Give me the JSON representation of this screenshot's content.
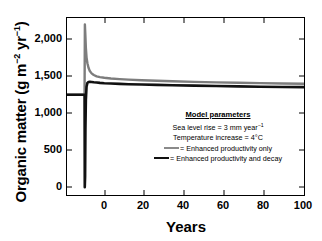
{
  "chart_data": {
    "type": "line",
    "title": "",
    "xlabel": "Years",
    "ylabel": "Organic matter (g m-2 yr-1)",
    "ylabel_parts": {
      "main": "Organic matter (g m",
      "sup1": "−2",
      "mid": " yr",
      "sup2": "−1",
      "end": ")"
    },
    "xlim": [
      -8,
      100
    ],
    "ylim": [
      -400,
      2300
    ],
    "xticks": [
      0,
      20,
      40,
      60,
      80,
      100
    ],
    "xtick_labels": [
      "0",
      "20",
      "40",
      "60",
      "80",
      "100"
    ],
    "yticks": [
      0,
      500,
      1000,
      1500,
      2000
    ],
    "ytick_labels": [
      "0",
      "500",
      "1,000",
      "1,500",
      "2,000"
    ],
    "grid": false,
    "legend_position": "inside-center",
    "series": [
      {
        "name": "Enhanced productivity only",
        "color": "#7d7d7d",
        "x": [
          -8,
          -4,
          -0.6,
          -0.2,
          0,
          0.15,
          0.35,
          0.6,
          0.9,
          1.3,
          1.8,
          2.4,
          3.2,
          4.2,
          5.5,
          7,
          9,
          12,
          16,
          20,
          26,
          33,
          40,
          50,
          60,
          70,
          80,
          90,
          100
        ],
        "values": [
          1130,
          1130,
          1130,
          1130,
          1130,
          2200,
          2050,
          1840,
          1700,
          1610,
          1540,
          1490,
          1455,
          1430,
          1410,
          1398,
          1388,
          1378,
          1368,
          1360,
          1350,
          1342,
          1335,
          1326,
          1318,
          1312,
          1306,
          1301,
          1297
        ]
      },
      {
        "name": "Enhanced productivity and decay",
        "color": "#111111",
        "x": [
          -8,
          -4,
          -0.6,
          -0.2,
          0,
          0.1,
          0.25,
          0.4,
          0.6,
          0.9,
          1.3,
          1.8,
          2.4,
          3.2,
          4.2,
          5.5,
          7,
          9,
          12,
          16,
          20,
          26,
          33,
          40,
          50,
          60,
          70,
          80,
          90,
          100
        ],
        "values": [
          1130,
          1130,
          1130,
          1130,
          1130,
          -280,
          -120,
          600,
          1050,
          1250,
          1310,
          1325,
          1328,
          1325,
          1320,
          1315,
          1310,
          1305,
          1300,
          1295,
          1290,
          1285,
          1280,
          1275,
          1268,
          1262,
          1257,
          1252,
          1248,
          1245
        ]
      }
    ],
    "annotations": {
      "legend_box": {
        "title": "Model parameters",
        "lines": [
          {
            "text_main": "Sea level rise = 3 mm year",
            "sup": "−1"
          },
          {
            "text_main": "Temperature increase = 4°C",
            "sup": ""
          }
        ],
        "entries": [
          {
            "label": "= Enhanced productivity only",
            "swatch": "gray"
          },
          {
            "label": "= Enhanced productivity and decay",
            "swatch": "black"
          }
        ]
      }
    }
  }
}
